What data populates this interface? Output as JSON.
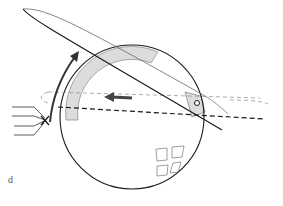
{
  "figure": {
    "panel_label": "d",
    "colors": {
      "stroke": "#1a1a1a",
      "thin_stroke": "#555555",
      "dashed_light": "#888888",
      "band_fill": "#dcdcdc",
      "arrow_fill": "#444444",
      "background": "#ffffff"
    },
    "elements": [
      {
        "name": "sphere-outline",
        "type": "circle"
      },
      {
        "name": "elongated-body",
        "type": "lens-shape"
      },
      {
        "name": "shaded-arc-band",
        "type": "band"
      },
      {
        "name": "curved-arrow",
        "type": "arrow",
        "direction": "upward-clockwise"
      },
      {
        "name": "straight-arrow",
        "type": "arrow",
        "direction": "left"
      },
      {
        "name": "dashed-orbit-ellipse",
        "type": "dashed-ellipse"
      },
      {
        "name": "dashed-axis-line",
        "type": "dashed-line"
      },
      {
        "name": "fan-lines",
        "type": "line-group",
        "count": 4
      },
      {
        "name": "pivot-circle",
        "type": "small-circle"
      },
      {
        "name": "window-grid",
        "type": "squares",
        "count": 4
      }
    ]
  }
}
